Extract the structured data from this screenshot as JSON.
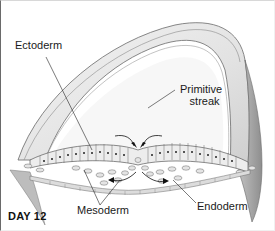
{
  "figure": {
    "title": "DAY 12",
    "labels": {
      "ectoderm": "Ectoderm",
      "primitive_streak_line1": "Primitive",
      "primitive_streak_line2": "streak",
      "mesoderm": "Mesoderm",
      "endoderm": "Endoderm"
    },
    "colors": {
      "background": "#ffffff",
      "tissue_light": "#e6e6e6",
      "tissue_mid": "#c8c8c8",
      "tissue_dark": "#9a9a9a",
      "outline": "#5a5a5a",
      "nucleus": "#222222",
      "text": "#1a1a1a"
    }
  }
}
